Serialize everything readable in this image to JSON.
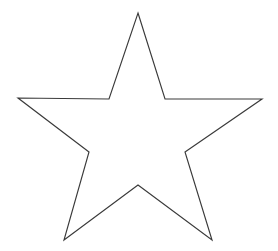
{
  "canvas": {
    "width": 278,
    "height": 251,
    "background_color": "#ffffff",
    "description": "Plain white page containing a single line-art five-pointed star outline, no text or UI chrome."
  },
  "figure": {
    "name": "five-pointed-star",
    "shape_type": "star",
    "points": 5,
    "filled": false,
    "stroke_color": "#3a3a3a",
    "stroke_width": 1.15,
    "fill_color": "none",
    "closed": true,
    "orientation": "point-up",
    "bounding_box": {
      "x": 18,
      "y": 13,
      "width": 244,
      "height": 227
    },
    "outer_vertices": [
      {
        "label": "top-apex",
        "x": 138,
        "y": 13
      },
      {
        "label": "right-point",
        "x": 262,
        "y": 99
      },
      {
        "label": "bottom-right-point",
        "x": 212,
        "y": 240
      },
      {
        "label": "bottom-left-point",
        "x": 64,
        "y": 240
      },
      {
        "label": "left-point",
        "x": 18,
        "y": 98
      }
    ],
    "inner_vertices": [
      {
        "label": "inner-top-right",
        "x": 165,
        "y": 99
      },
      {
        "label": "inner-right",
        "x": 185,
        "y": 152
      },
      {
        "label": "inner-bottom",
        "x": 138,
        "y": 185
      },
      {
        "label": "inner-left",
        "x": 89,
        "y": 152
      },
      {
        "label": "inner-top-left",
        "x": 109,
        "y": 99
      }
    ],
    "path_points": "138,13 165,99 262,99 185,152 212,240 138,185 64,240 89,152 18,98 109,99"
  }
}
